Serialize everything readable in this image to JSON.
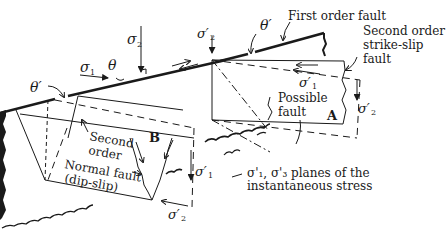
{
  "diagram": {
    "type": "fault-stress-schematic",
    "labels": {
      "first_order_fault": "First order fault",
      "second_order_strike_slip_l1": "Second order",
      "second_order_strike_slip_l2": "strike-slip",
      "second_order_strike_slip_l3": "fault",
      "possible_fault_l1": "Possible",
      "possible_fault_l2": "fault",
      "block_a": "A",
      "block_b": "B",
      "second_order_normal_l1": "Second",
      "second_order_normal_l2": "order",
      "normal_fault_l1": "Normal fault",
      "normal_fault_l2": "(dip-slip)",
      "planes_caption_l1": "σ'₁, σ'₃ planes of the",
      "planes_caption_l2": "instantaneous stress"
    },
    "symbols": {
      "sigma1": "σ",
      "sigma1_sub": "1",
      "sigma2": "σ",
      "sigma2_sub": "2",
      "theta": "θ",
      "theta_prime_left": "θ′",
      "theta_prime_top": "θ′",
      "sigma2_prime_top": "σ′",
      "sigma2_prime_top_sub": "2",
      "sigma1_prime_a": "σ′",
      "sigma1_prime_a_sub": "1",
      "sigma2_prime_a": "σ′",
      "sigma2_prime_a_sub": "2",
      "sigma1_prime_b": "σ′",
      "sigma1_prime_b_sub": "1",
      "sigma2_prime_b": "σ′",
      "sigma2_prime_b_sub": "2"
    },
    "colors": {
      "ink": "#1a1a1a",
      "background": "#ffffff"
    }
  }
}
